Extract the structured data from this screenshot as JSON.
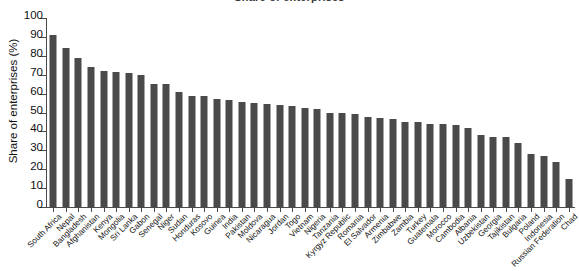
{
  "chart_data": {
    "type": "bar",
    "title": "Share of enterprises",
    "xlabel": "",
    "ylabel": "Share of enterprises (%)",
    "ylim": [
      0,
      100
    ],
    "yticks": [
      0,
      10,
      20,
      30,
      40,
      50,
      60,
      70,
      80,
      90,
      100
    ],
    "grid": false,
    "legend": "none",
    "bar_color": "#4a4a4a",
    "categories": [
      "South Africa",
      "Nepal",
      "Bangladesh",
      "Afghanistan",
      "Kenya",
      "Mongolia",
      "Sri Lanka",
      "Gabon",
      "Senegal",
      "Niger",
      "Sudan",
      "Honduras",
      "Kosovo",
      "Guinea",
      "India",
      "Pakistan",
      "Moldova",
      "Nicaragua",
      "Jordan",
      "Togo",
      "Vietnam",
      "Nigeria",
      "Tanzania",
      "Kyrgyz Republic",
      "Romania",
      "El Salvador",
      "Armenia",
      "Zimbabwe",
      "Zambia",
      "Turkey",
      "Guatemala",
      "Morocco",
      "Cambodia",
      "Albania",
      "Uzbekistan",
      "Georgia",
      "Tajikistan",
      "Bulgaria",
      "Poland",
      "Indonesia",
      "Russian Federation",
      "Chad"
    ],
    "values": [
      91,
      84,
      79,
      74,
      72,
      71.5,
      71,
      70,
      65,
      65,
      61,
      59,
      58.5,
      57,
      56.5,
      55.5,
      55,
      54.5,
      54,
      53.5,
      52.5,
      52,
      50,
      49.5,
      49,
      47.5,
      47,
      46.5,
      45,
      45,
      44,
      44,
      43.5,
      42,
      38,
      37,
      37,
      34,
      28,
      27,
      24,
      15
    ],
    "units": "%"
  },
  "axes": {
    "y_title": "Share of enterprises (%)"
  }
}
